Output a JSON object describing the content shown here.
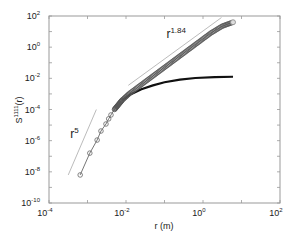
{
  "chart_data": {
    "type": "scatter",
    "title": "",
    "xlabel": "r (m)",
    "ylabel": "S^{1111}(r)",
    "xscale": "log",
    "yscale": "log",
    "xlim": [
      0.0001,
      100
    ],
    "ylim": [
      1e-10,
      100
    ],
    "grid": false,
    "legend": null,
    "x_ticks": [
      {
        "base": "10",
        "exp": "-4",
        "value": -4
      },
      {
        "base": "10",
        "exp": "-2",
        "value": -2
      },
      {
        "base": "10",
        "exp": "0",
        "value": 0
      },
      {
        "base": "10",
        "exp": "2",
        "value": 2
      }
    ],
    "y_ticks": [
      {
        "base": "10",
        "exp": "2",
        "value": 2
      },
      {
        "base": "10",
        "exp": "0",
        "value": 0
      },
      {
        "base": "10",
        "exp": "-2",
        "value": -2
      },
      {
        "base": "10",
        "exp": "-4",
        "value": -4
      },
      {
        "base": "10",
        "exp": "-6",
        "value": -6
      },
      {
        "base": "10",
        "exp": "-8",
        "value": -8
      },
      {
        "base": "10",
        "exp": "-10",
        "value": -10
      }
    ],
    "series": [
      {
        "name": "S1111 markers (circles)",
        "style": "markers-line",
        "color": "#555555",
        "log10_points": [
          [
            -3.19,
            -8.2
          ],
          [
            -2.94,
            -6.8
          ],
          [
            -2.75,
            -5.96
          ],
          [
            -2.65,
            -5.38
          ],
          [
            -2.52,
            -4.93
          ],
          [
            -2.45,
            -4.6
          ],
          [
            -2.39,
            -4.35
          ],
          [
            -2.3,
            -4.0
          ],
          [
            -2.2,
            -3.7
          ],
          [
            -2.1,
            -3.4
          ],
          [
            -1.9,
            -2.95
          ],
          [
            -1.6,
            -2.4
          ],
          [
            -1.3,
            -1.85
          ],
          [
            -1.0,
            -1.3
          ],
          [
            -0.7,
            -0.75
          ],
          [
            -0.4,
            -0.2
          ],
          [
            -0.1,
            0.35
          ],
          [
            0.2,
            0.9
          ],
          [
            0.5,
            1.35
          ],
          [
            0.78,
            1.6
          ]
        ]
      },
      {
        "name": "S1111 saturating curve",
        "style": "line",
        "color": "#111111",
        "log10_points": [
          [
            -2.1,
            -3.4
          ],
          [
            -1.9,
            -3.05
          ],
          [
            -1.6,
            -2.7
          ],
          [
            -1.3,
            -2.45
          ],
          [
            -1.0,
            -2.25
          ],
          [
            -0.6,
            -2.08
          ],
          [
            -0.2,
            -1.98
          ],
          [
            0.3,
            -1.92
          ],
          [
            0.78,
            -1.9
          ]
        ]
      }
    ],
    "reference_lines": [
      {
        "label_base": "r",
        "label_exp": "5",
        "slope": 5,
        "log10_from": [
          -3.5,
          -8.2
        ],
        "log10_to": [
          -2.77,
          -4.0
        ],
        "label_pos": [
          -3.45,
          -5.8
        ]
      },
      {
        "label_base": "r",
        "label_exp": "1.84",
        "slope": 1.84,
        "log10_from": [
          -1.94,
          -2.45
        ],
        "log10_to": [
          0.48,
          1.9
        ],
        "label_pos": [
          -0.95,
          0.6
        ]
      }
    ]
  }
}
